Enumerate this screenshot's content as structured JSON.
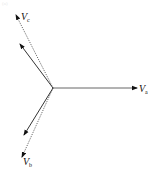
{
  "diagram": {
    "type": "phasor-diagram",
    "panel_label": "(a)",
    "origin": {
      "x": 53,
      "y": 88
    },
    "phasors": [
      {
        "id": "Va",
        "label": "V",
        "subscript": "a",
        "style": "solid",
        "color": "#555555",
        "to": {
          "x": 137,
          "y": 88
        },
        "label_pos": {
          "x": 139,
          "y": 92
        },
        "sub_pos": {
          "x": 145,
          "y": 94
        }
      },
      {
        "id": "Vc",
        "label": "V",
        "subscript": "c",
        "style": "dotted",
        "color": "#444444",
        "to": {
          "x": 16,
          "y": 14
        },
        "label_pos": {
          "x": 21,
          "y": 20
        },
        "sub_pos": {
          "x": 27,
          "y": 22
        }
      },
      {
        "id": "Vb",
        "label": "V",
        "subscript": "b",
        "style": "dotted",
        "color": "#444444",
        "to": {
          "x": 22,
          "y": 158
        },
        "label_pos": {
          "x": 23,
          "y": 165
        },
        "sub_pos": {
          "x": 29,
          "y": 167
        }
      },
      {
        "id": "Vc_solid",
        "label": "",
        "subscript": "",
        "style": "solid",
        "color": "#333333",
        "to": {
          "x": 20,
          "y": 44
        }
      },
      {
        "id": "Vb_solid",
        "label": "",
        "subscript": "",
        "style": "solid",
        "color": "#333333",
        "to": {
          "x": 24,
          "y": 135
        }
      }
    ],
    "labels": {
      "va_main": "V",
      "va_sub": "a",
      "vb_main": "V",
      "vb_sub": "b",
      "vc_main": "V",
      "vc_sub": "c",
      "panel": "(a)"
    }
  }
}
